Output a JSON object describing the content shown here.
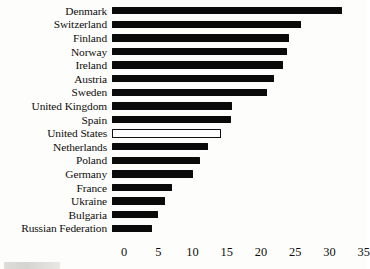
{
  "chart_data": {
    "type": "bar",
    "orientation": "horizontal",
    "title": "",
    "xlabel": "",
    "ylabel": "",
    "xlim": [
      0,
      35
    ],
    "grid": false,
    "legend": null,
    "highlight": {
      "category": "United States",
      "style": "hollow-outline"
    },
    "categories": [
      "Denmark",
      "Switzerland",
      "Finland",
      "Norway",
      "Ireland",
      "Austria",
      "Sweden",
      "United Kingdom",
      "Spain",
      "United States",
      "Netherlands",
      "Poland",
      "Germany",
      "France",
      "Ukraine",
      "Bulgaria",
      "Russian Federation"
    ],
    "values": [
      33.0,
      27.0,
      25.2,
      25.0,
      24.4,
      23.0,
      22.1,
      16.9,
      16.8,
      15.4,
      13.5,
      12.3,
      11.2,
      8.2,
      7.2,
      6.2,
      5.2
    ],
    "xticks": [
      0,
      5,
      10,
      15,
      20,
      25,
      30,
      35
    ],
    "xtick_labels": [
      "0",
      "5",
      "10",
      "15",
      "20",
      "25",
      "30",
      "35"
    ]
  },
  "style": {
    "bar_color": "#0a0a0a",
    "highlight_fill": "#ffffff",
    "highlight_border": "#111111",
    "background": "#fdfdfb",
    "text_color": "#0d0d0d"
  }
}
